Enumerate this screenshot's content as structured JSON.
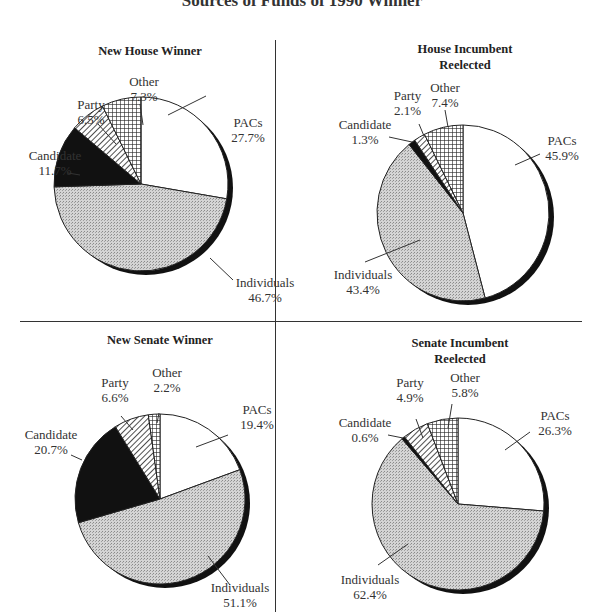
{
  "figure": {
    "title_fragment": "Sources of Funds of 1990 Winner"
  },
  "chart_data": [
    {
      "type": "pie",
      "title": "New House Winner",
      "categories": [
        "PACs",
        "Individuals",
        "Candidate",
        "Party",
        "Other"
      ],
      "values": [
        27.7,
        46.7,
        11.7,
        6.5,
        7.3
      ],
      "labels": [
        "27.7%",
        "46.7%",
        "11.7%",
        "6.5%",
        "7.3%"
      ]
    },
    {
      "type": "pie",
      "title": "House Incumbent Reelected",
      "categories": [
        "PACs",
        "Individuals",
        "Candidate",
        "Party",
        "Other"
      ],
      "values": [
        45.9,
        43.4,
        1.3,
        2.1,
        7.4
      ],
      "labels": [
        "45.9%",
        "43.4%",
        "1.3%",
        "2.1%",
        "7.4%"
      ]
    },
    {
      "type": "pie",
      "title": "New Senate Winner",
      "categories": [
        "PACs",
        "Individuals",
        "Candidate",
        "Party",
        "Other"
      ],
      "values": [
        19.4,
        51.1,
        20.7,
        6.6,
        2.2
      ],
      "labels": [
        "19.4%",
        "51.1%",
        "20.7%",
        "6.6%",
        "2.2%"
      ]
    },
    {
      "type": "pie",
      "title": "Senate Incumbent Reelected",
      "categories": [
        "PACs",
        "Individuals",
        "Candidate",
        "Party",
        "Other"
      ],
      "values": [
        26.3,
        62.4,
        0.6,
        4.9,
        5.8
      ],
      "labels": [
        "26.3%",
        "62.4%",
        "0.6%",
        "4.9%",
        "5.8%"
      ]
    }
  ],
  "panels": {
    "tl": {
      "title": "New House Winner",
      "pacs": "PACs",
      "pacs_v": "27.7%",
      "ind": "Individuals",
      "ind_v": "46.7%",
      "cand": "Candidate",
      "cand_v": "11.7%",
      "party": "Party",
      "party_v": "6.5%",
      "other": "Other",
      "other_v": "7.3%"
    },
    "tr": {
      "title1": "House Incumbent",
      "title2": "Reelected",
      "pacs": "PACs",
      "pacs_v": "45.9%",
      "ind": "Individuals",
      "ind_v": "43.4%",
      "cand": "Candidate",
      "cand_v": "1.3%",
      "party": "Party",
      "party_v": "2.1%",
      "other": "Other",
      "other_v": "7.4%"
    },
    "bl": {
      "title": "New Senate Winner",
      "pacs": "PACs",
      "pacs_v": "19.4%",
      "ind": "Individuals",
      "ind_v": "51.1%",
      "cand": "Candidate",
      "cand_v": "20.7%",
      "party": "Party",
      "party_v": "6.6%",
      "other": "Other",
      "other_v": "2.2%"
    },
    "br": {
      "title1": "Senate Incumbent",
      "title2": "Reelected",
      "pacs": "PACs",
      "pacs_v": "26.3%",
      "ind": "Individuals",
      "ind_v": "62.4%",
      "cand": "Candidate",
      "cand_v": "0.6%",
      "party": "Party",
      "party_v": "4.9%",
      "other": "Other",
      "other_v": "5.8%"
    }
  },
  "colors": {
    "pacs": "#ffffff",
    "individuals": "#c8c8c8",
    "candidate": "#111111",
    "shadow": "#111111",
    "outline": "#222222"
  }
}
